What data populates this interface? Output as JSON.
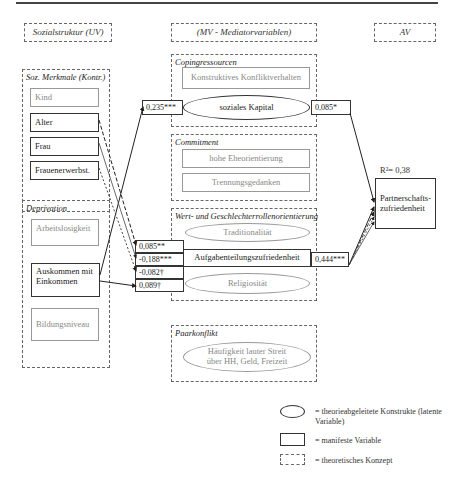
{
  "headers": {
    "uv": "Sozialstruktur (UV)",
    "mv": "(MV - Mediatorvariablen)",
    "av": "AV"
  },
  "groups": {
    "soz_merkmale": {
      "title": "Soz. Merkmale (Kontr.)",
      "items": [
        "Kind",
        "Alter",
        "Frau",
        "Frauenerwerbst."
      ]
    },
    "deprivation": {
      "title": "Deprivation",
      "items": [
        "Arbeitslosigkeit",
        "Auskommen mit Einkommen",
        "Bildungsniveau"
      ]
    },
    "copingressourcen": {
      "title": "Copingressourcen",
      "box": "Konstruktives Konfliktverhalten",
      "ellipse": "soziales Kapital"
    },
    "commitment": {
      "title": "Commitment",
      "items": [
        "hohe Eheorientierung",
        "Trennungsgedanken"
      ]
    },
    "wert": {
      "title": "Wert- und Geschlechterrollenorientierung",
      "ellipse_top": "Traditionalität",
      "box": "Aufgabenteilungszufriedenheit",
      "ellipse_bottom": "Religiosität"
    },
    "paarkonflikt": {
      "title": "Paarkonflikt",
      "ellipse": "Häufigkeit lauter Streit über HH, Geld, Freizeit"
    }
  },
  "outcome": {
    "label": "Partnerschafts-zufriedenheit",
    "r2": "R²= 0,38"
  },
  "coefficients": {
    "income_to_social_capital": "0,235***",
    "social_capital_to_outcome": "0,085*",
    "to_division_1": "0,085**",
    "to_division_2": "-0,188***",
    "to_division_3": "-0,082†",
    "to_division_4": "0,089†",
    "division_to_outcome": "0,444***"
  },
  "legend": {
    "ellipse": "= theorieabgeleitete Konstrukte (latente Variable)",
    "box": "= manifeste Variable",
    "dashed": "= theoretisches Konzept"
  }
}
